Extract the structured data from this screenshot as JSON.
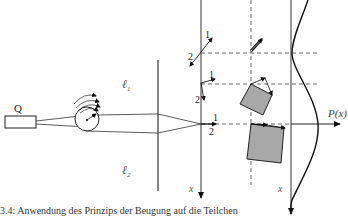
{
  "diagram": {
    "source_label": "Q",
    "slit_labels": {
      "upper": "ℓ",
      "upper_sub": "1",
      "lower": "ℓ",
      "lower_sub": "2"
    },
    "axis_labels": {
      "x_axis_1": "x",
      "x_axis_2": "x",
      "probability": "P(x)"
    },
    "path_labels": {
      "top_path_1": "1",
      "top_path_2": "2",
      "mid_path_1": "1",
      "mid_path_2": "2",
      "center_path_1": "1",
      "center_path_2": "2"
    },
    "caption": "3.4: Anwendung des Prinzips der Beugung auf die Teilchen"
  },
  "colors": {
    "line": "#222222",
    "box_fill": "#a8a8a8",
    "dashed": "#444444"
  }
}
